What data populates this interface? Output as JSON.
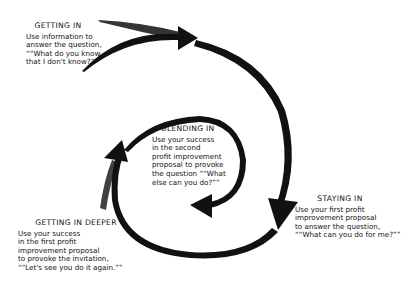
{
  "diagram": {
    "stages": [
      {
        "id": "getting-in",
        "title": "GETTING IN",
        "lines": [
          "Use information to",
          "answer the question,",
          "““What do you know",
          "that I don't know?””"
        ]
      },
      {
        "id": "staying-in",
        "title": "STAYING IN",
        "lines": [
          "Use your first profit",
          "improvement proposal",
          "to answer the question,",
          "““What can you do for me?””"
        ]
      },
      {
        "id": "getting-in-deeper",
        "title": "GETTING IN DEEPER",
        "lines": [
          "Use your success",
          "in the first profit",
          "improvement proposal",
          "to provoke the invitation,",
          "““Let's see you do it again.””"
        ]
      },
      {
        "id": "blending-in",
        "title": "BLENDING IN",
        "lines": [
          "Use your success",
          "in the second",
          "profit improvement",
          "proposal to provoke",
          "the question ““What",
          "else can you do?””"
        ]
      }
    ],
    "colors": {
      "ink": "#111111",
      "background": "#ffffff"
    }
  }
}
